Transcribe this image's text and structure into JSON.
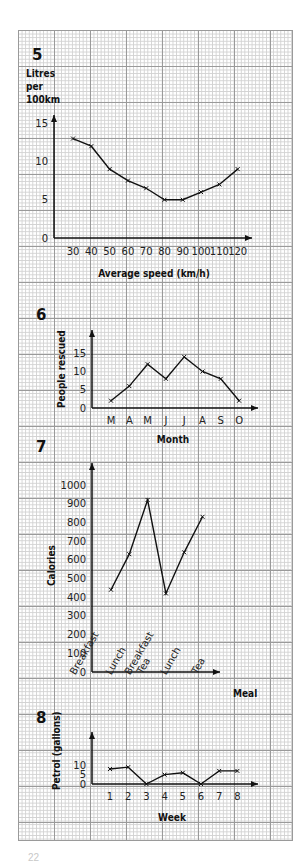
{
  "page": {
    "page_number_fragment": "22"
  },
  "chart_data": [
    {
      "id": "q5",
      "question_number": "5",
      "type": "line",
      "title": "",
      "ylabel_lines": [
        "Litres",
        "per",
        "100km"
      ],
      "ylabel": "Litres per 100km",
      "xlabel": "Average speed (km/h)",
      "x": [
        30,
        40,
        50,
        60,
        70,
        80,
        90,
        100,
        110,
        120
      ],
      "values": [
        13,
        12,
        9,
        7.5,
        6.5,
        5,
        5,
        6,
        7,
        9
      ],
      "yticks": [
        0,
        5,
        10,
        15
      ],
      "ylim": [
        0,
        17
      ],
      "grid": true,
      "legend": null
    },
    {
      "id": "q6",
      "question_number": "6",
      "type": "line",
      "ylabel": "People rescued",
      "xlabel": "Month",
      "categories": [
        "M",
        "A",
        "M",
        "J",
        "J",
        "A",
        "S",
        "O"
      ],
      "values": [
        2,
        6,
        12,
        8,
        14,
        10,
        8,
        2
      ],
      "yticks": [
        0,
        5,
        10,
        15
      ],
      "ylim": [
        0,
        20
      ],
      "grid": true,
      "legend": null
    },
    {
      "id": "q7",
      "question_number": "7",
      "type": "line",
      "ylabel": "Calories",
      "xlabel": "Meal",
      "categories": [
        "Breakfast",
        "Lunch",
        "Tea",
        "Breakfast",
        "Lunch",
        "Tea"
      ],
      "values": [
        440,
        630,
        920,
        420,
        640,
        830
      ],
      "yticks": [
        0,
        100,
        200,
        300,
        400,
        500,
        600,
        700,
        800,
        900,
        1000
      ],
      "ylim": [
        0,
        1100
      ],
      "grid": true,
      "legend": null
    },
    {
      "id": "q8",
      "question_number": "8",
      "type": "line",
      "ylabel": "Petrol (gallons)",
      "xlabel": "Week",
      "categories": [
        "1",
        "2",
        "3",
        "4",
        "5",
        "6",
        "7",
        "8"
      ],
      "values": [
        8,
        9,
        0,
        5,
        6,
        0,
        7,
        7
      ],
      "yticks": [
        0,
        5,
        10
      ],
      "ylim": [
        0,
        14
      ],
      "grid": true,
      "legend": null
    }
  ]
}
